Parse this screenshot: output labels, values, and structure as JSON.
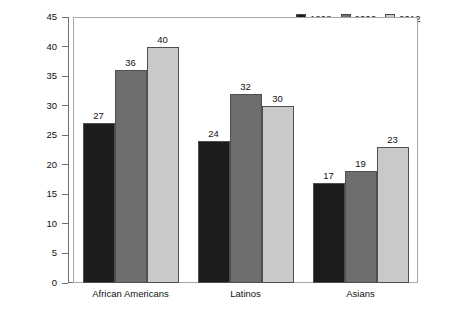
{
  "chart_data": {
    "type": "bar",
    "title": "",
    "xlabel": "",
    "ylabel_line1": "Percent of predominantly (at least 90 percent) white",
    "ylabel_line2": "congregations with some presence of each group",
    "categories": [
      "African Americans",
      "Latinos",
      "Asians"
    ],
    "series": [
      {
        "name": "1998",
        "color": "#1c1c1c",
        "values": [
          27,
          24,
          17
        ]
      },
      {
        "name": "2006",
        "color": "#6e6e6e",
        "values": [
          36,
          32,
          19
        ]
      },
      {
        "name": "2012",
        "color": "#c9c9c9",
        "values": [
          40,
          30,
          23
        ]
      }
    ],
    "ylim": [
      0,
      45
    ],
    "yticks": [
      0,
      5,
      10,
      15,
      20,
      25,
      30,
      35,
      40,
      45
    ],
    "grid": false,
    "legend_position": "top-right",
    "value_labels": true
  }
}
